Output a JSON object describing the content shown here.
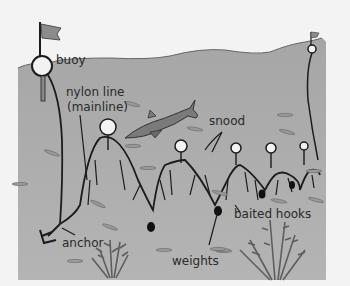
{
  "diagram": {
    "labels": {
      "buoy": "buoy",
      "mainline_1": "nylon line",
      "mainline_2": "(mainline)",
      "snood": "snood",
      "baited_hooks": "baited hooks",
      "anchor": "anchor",
      "weights": "weights"
    },
    "colors": {
      "background": "#f3f3f3",
      "water": "#a9a9a9",
      "water_deep": "#9e9e9e",
      "line": "#1c1c1c",
      "float": "#f2f2f2",
      "flag": "#8c8c8c",
      "shark": "#7a7a7a",
      "seaweed": "#6a6a6a"
    }
  }
}
